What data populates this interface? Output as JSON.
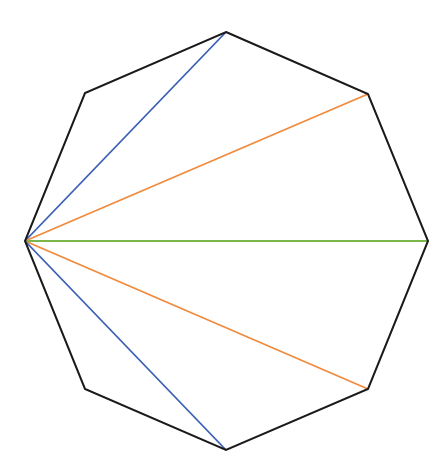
{
  "diagram": {
    "title": "",
    "shape": "regular octagon",
    "vertices": [
      {
        "name": "top",
        "x": 226,
        "y": 32
      },
      {
        "name": "upper-right",
        "x": 368,
        "y": 94
      },
      {
        "name": "right",
        "x": 428,
        "y": 241
      },
      {
        "name": "lower-right",
        "x": 368,
        "y": 389
      },
      {
        "name": "bottom",
        "x": 226,
        "y": 450
      },
      {
        "name": "lower-left",
        "x": 85,
        "y": 389
      },
      {
        "name": "left",
        "x": 25,
        "y": 241
      },
      {
        "name": "upper-left",
        "x": 85,
        "y": 93
      }
    ],
    "outline_color": "#1a1a1a",
    "diagonals": [
      {
        "name": "diagonal-left-to-top",
        "from": 6,
        "to": 0,
        "color": "#3b5fb5"
      },
      {
        "name": "diagonal-left-to-upper-right",
        "from": 6,
        "to": 1,
        "color": "#f08a3c"
      },
      {
        "name": "diagonal-left-to-right",
        "from": 6,
        "to": 2,
        "color": "#7ab648"
      },
      {
        "name": "diagonal-left-to-lower-right",
        "from": 6,
        "to": 3,
        "color": "#f08a3c"
      },
      {
        "name": "diagonal-left-to-bottom",
        "from": 6,
        "to": 4,
        "color": "#3b5fb5"
      }
    ]
  }
}
